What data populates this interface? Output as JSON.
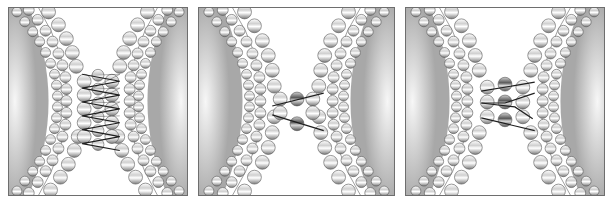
{
  "figure": {
    "panels": [
      {
        "id": "panel-1",
        "label": "",
        "stage": "helical bundle bridging membranes",
        "x": 8,
        "width": 180,
        "linker_style": "zigzag",
        "linker_count": 8
      },
      {
        "id": "panel-2",
        "label": "",
        "stage": "two-bead linker bridge",
        "x": 198,
        "width": 197,
        "linker_style": "crossed",
        "linker_count": 2
      },
      {
        "id": "panel-3",
        "label": "",
        "stage": "three-bead linker bridge",
        "x": 405,
        "width": 200,
        "linker_style": "crossed",
        "linker_count": 4
      }
    ],
    "colors": {
      "background_gradient_dark": "#a8a8a8",
      "background_gradient_light": "#f4f4f4",
      "bead_light": "#ffffff",
      "bead_dark": "#8a8a8a",
      "linker_bead_dark": "#5a5a5a",
      "linker_line": "#1e1e1e",
      "border": "#6e6e6e"
    }
  }
}
